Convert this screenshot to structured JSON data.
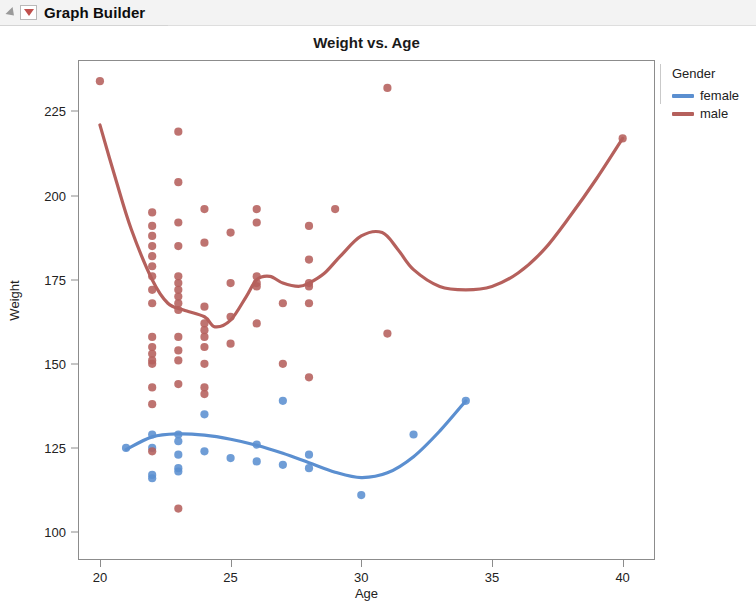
{
  "window": {
    "title": "Graph Builder",
    "disclosure_icon": "disclosure-triangle-icon",
    "report_icon": "red-triangle-menu-icon"
  },
  "chart_data": {
    "type": "scatter",
    "title": "Weight vs. Age",
    "xlabel": "Age",
    "ylabel": "Weight",
    "xlim": [
      19.2,
      41.2
    ],
    "ylim": [
      92,
      240
    ],
    "xticks": [
      20,
      25,
      30,
      35,
      40
    ],
    "yticks": [
      100,
      125,
      150,
      175,
      200,
      225
    ],
    "grid": false,
    "legend": {
      "title": "Gender",
      "position": "right",
      "entries": [
        {
          "name": "female",
          "color": "#5b8fd0"
        },
        {
          "name": "male",
          "color": "#b5605c"
        }
      ]
    },
    "series": [
      {
        "name": "female",
        "color": "#5b8fd0",
        "marker": "circle",
        "points": [
          [
            21,
            125
          ],
          [
            22,
            129
          ],
          [
            22,
            125
          ],
          [
            22,
            117
          ],
          [
            22,
            116
          ],
          [
            23,
            129
          ],
          [
            23,
            127
          ],
          [
            23,
            123
          ],
          [
            23,
            119
          ],
          [
            23,
            118
          ],
          [
            24,
            135
          ],
          [
            24,
            124
          ],
          [
            25,
            122
          ],
          [
            26,
            126
          ],
          [
            26,
            121
          ],
          [
            27,
            139
          ],
          [
            27,
            120
          ],
          [
            28,
            123
          ],
          [
            28,
            119
          ],
          [
            30,
            111
          ],
          [
            32,
            129
          ],
          [
            34,
            139
          ]
        ],
        "fit_curve": {
          "type": "spline",
          "points": [
            [
              21,
              124.5
            ],
            [
              22,
              128.3
            ],
            [
              23,
              129.2
            ],
            [
              24,
              128.8
            ],
            [
              25,
              127.6
            ],
            [
              26,
              125.8
            ],
            [
              27,
              123.4
            ],
            [
              28,
              120.6
            ],
            [
              29,
              117.8
            ],
            [
              30,
              116.2
            ],
            [
              31,
              117.6
            ],
            [
              32,
              122.4
            ],
            [
              33,
              130.0
            ],
            [
              34,
              139.0
            ]
          ]
        }
      },
      {
        "name": "male",
        "color": "#b5605c",
        "marker": "circle",
        "points": [
          [
            20,
            234
          ],
          [
            22,
            195
          ],
          [
            22,
            191
          ],
          [
            22,
            188
          ],
          [
            22,
            185
          ],
          [
            22,
            182
          ],
          [
            22,
            179
          ],
          [
            22,
            176
          ],
          [
            22,
            172
          ],
          [
            22,
            168
          ],
          [
            22,
            158
          ],
          [
            22,
            155
          ],
          [
            22,
            153
          ],
          [
            22,
            151
          ],
          [
            22,
            150
          ],
          [
            22,
            143
          ],
          [
            22,
            138
          ],
          [
            22,
            124
          ],
          [
            23,
            219
          ],
          [
            23,
            204
          ],
          [
            23,
            192
          ],
          [
            23,
            185
          ],
          [
            23,
            176
          ],
          [
            23,
            174
          ],
          [
            23,
            172
          ],
          [
            23,
            170
          ],
          [
            23,
            168
          ],
          [
            23,
            166
          ],
          [
            23,
            158
          ],
          [
            23,
            154
          ],
          [
            23,
            151
          ],
          [
            23,
            144
          ],
          [
            23,
            107
          ],
          [
            24,
            196
          ],
          [
            24,
            186
          ],
          [
            24,
            167
          ],
          [
            24,
            162
          ],
          [
            24,
            160
          ],
          [
            24,
            158
          ],
          [
            24,
            155
          ],
          [
            24,
            150
          ],
          [
            24,
            143
          ],
          [
            24,
            141
          ],
          [
            25,
            189
          ],
          [
            25,
            174
          ],
          [
            25,
            164
          ],
          [
            25,
            156
          ],
          [
            26,
            196
          ],
          [
            26,
            192
          ],
          [
            26,
            176
          ],
          [
            26,
            174
          ],
          [
            26,
            173
          ],
          [
            26,
            162
          ],
          [
            27,
            168
          ],
          [
            27,
            150
          ],
          [
            28,
            191
          ],
          [
            28,
            181
          ],
          [
            28,
            174
          ],
          [
            28,
            173
          ],
          [
            28,
            168
          ],
          [
            28,
            146
          ],
          [
            29,
            196
          ],
          [
            31,
            232
          ],
          [
            31,
            159
          ],
          [
            40,
            217
          ]
        ],
        "fit_curve": {
          "type": "spline",
          "points": [
            [
              20,
              221
            ],
            [
              20.6,
              205
            ],
            [
              21.2,
              190
            ],
            [
              22,
              175
            ],
            [
              22.6,
              168
            ],
            [
              23.2,
              166
            ],
            [
              24,
              164
            ],
            [
              24.4,
              161
            ],
            [
              25,
              163
            ],
            [
              25.6,
              170
            ],
            [
              26,
              175
            ],
            [
              26.5,
              176
            ],
            [
              27,
              174
            ],
            [
              27.6,
              173
            ],
            [
              28,
              174
            ],
            [
              28.6,
              177
            ],
            [
              29.2,
              182
            ],
            [
              30,
              188
            ],
            [
              30.8,
              189
            ],
            [
              31.4,
              184
            ],
            [
              32,
              178
            ],
            [
              33,
              173
            ],
            [
              34,
              172
            ],
            [
              35,
              173
            ],
            [
              36,
              177
            ],
            [
              37,
              184
            ],
            [
              38,
              194
            ],
            [
              39,
              205
            ],
            [
              40,
              217
            ]
          ]
        }
      }
    ]
  }
}
